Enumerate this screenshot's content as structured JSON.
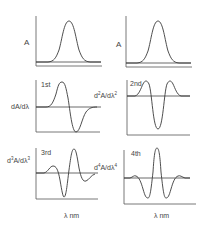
{
  "panels": {
    "zero": {
      "ylabel": "A",
      "curve": "gaussian absorption band"
    },
    "zero_right": {
      "ylabel": "A",
      "curve": "gaussian absorption band"
    },
    "first": {
      "order_label": "1st",
      "ylabel_base": "dA/d",
      "ylabel_lambda": "λ"
    },
    "second": {
      "order_label": "2nd",
      "ylabel_base": "d",
      "ylabel_exp": "2",
      "ylabel_mid": "A/dλ",
      "ylabel_exp2": "2"
    },
    "third": {
      "order_label": "3rd",
      "ylabel_base": "d",
      "ylabel_exp": "3",
      "ylabel_mid": "A/dλ",
      "ylabel_exp2": "3"
    },
    "fourth": {
      "order_label": "4th",
      "ylabel_base": "d",
      "ylabel_exp": "4",
      "ylabel_mid": "A/dλ",
      "ylabel_exp2": "4"
    }
  },
  "xaxis": {
    "left_label": "λ nm",
    "right_label": "λ nm"
  },
  "colors": {
    "curve": "#3a3a3a",
    "axis": "#555555",
    "baseline": "#444444",
    "text": "#444444"
  }
}
